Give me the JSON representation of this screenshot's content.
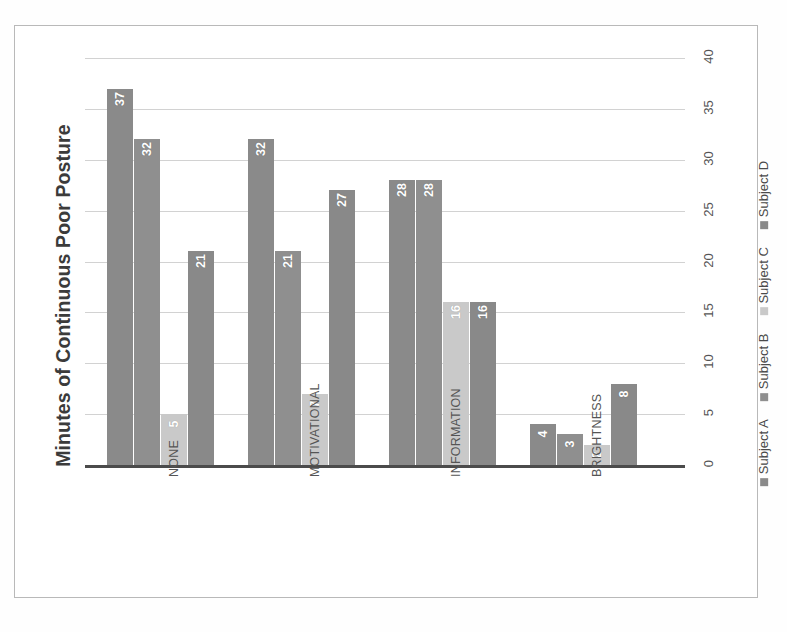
{
  "chart_data": {
    "type": "bar",
    "title": "",
    "xlabel": "",
    "ylabel": "Minutes of Continuous Poor Posture",
    "categories": [
      "NONE",
      "MOTIVATIONAL",
      "INFORMATION",
      "BRIGHTNESS"
    ],
    "series": [
      {
        "name": "Subject A",
        "color": "#8a8a8a",
        "values": [
          37,
          32,
          28,
          4
        ]
      },
      {
        "name": "Subject B",
        "color": "#8f8f8f",
        "values": [
          32,
          21,
          28,
          3
        ]
      },
      {
        "name": "Subject C",
        "color": "#c9c9c9",
        "values": [
          5,
          7,
          16,
          2
        ]
      },
      {
        "name": "Subject D",
        "color": "#898989",
        "values": [
          21,
          27,
          16,
          8
        ]
      }
    ],
    "ylim": [
      0,
      40
    ],
    "yticks": [
      0,
      5,
      10,
      15,
      20,
      25,
      30,
      35,
      40
    ],
    "ytick_labels": [
      "0",
      "5",
      "10",
      "15",
      "20",
      "25",
      "30",
      "35",
      "40"
    ],
    "grid": true,
    "legend_position": "right",
    "axis_position": "right",
    "label_rotation": -90,
    "data_labels": [
      [
        "37",
        "32",
        "5",
        "21"
      ],
      [
        "32",
        "21",
        "7",
        "27"
      ],
      [
        "28",
        "28",
        "16",
        "16"
      ],
      [
        "4",
        "3",
        "2",
        "8"
      ]
    ]
  },
  "legend": {
    "items": [
      {
        "label": "Subject A",
        "color": "#8a8a8a"
      },
      {
        "label": "Subject B",
        "color": "#8f8f8f"
      },
      {
        "label": "Subject C",
        "color": "#c9c9c9"
      },
      {
        "label": "Subject D",
        "color": "#898989"
      }
    ]
  },
  "colors": {
    "gridline": "#d2d2d2",
    "baseline": "#4b4b4b",
    "frame": "#b9b9b9",
    "text": "#555555",
    "title_text": "#3b3b3b",
    "background": "#ffffff"
  }
}
